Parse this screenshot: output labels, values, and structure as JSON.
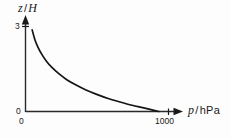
{
  "figure": {
    "background_color": "#fdfdfd",
    "ink_color": "#1a1a1a"
  },
  "axes": {
    "y": {
      "symbol": "z",
      "separator": "/",
      "unit": "H",
      "full_label": "z / H",
      "ticks": [
        "3",
        "0"
      ],
      "tick_values": [
        3,
        0
      ],
      "range": [
        0,
        3.4
      ]
    },
    "x": {
      "symbol": "p",
      "separator": "/",
      "unit": "hPa",
      "full_label": "p / hPa",
      "ticks": [
        "0",
        "1000"
      ],
      "tick_values": [
        0,
        1000
      ],
      "range": [
        0,
        1130
      ]
    }
  },
  "chart_data": {
    "type": "line",
    "title": "",
    "subtitle": "",
    "xlabel": "p / hPa",
    "ylabel": "z / H",
    "xlim": [
      0,
      1130
    ],
    "ylim": [
      0,
      3.4
    ],
    "grid": false,
    "legend": null,
    "legend_position": "none",
    "xticks": [
      0,
      1000
    ],
    "xticklabels": [
      "0",
      "1000"
    ],
    "yticks": [
      0,
      3
    ],
    "yticklabels": [
      "0",
      "3"
    ],
    "annotations": [],
    "series": [
      {
        "name": "barometric height vs pressure",
        "description": "exponential decay of normalized altitude with pressure",
        "x": [
          50,
          70,
          95,
          125,
          160,
          200,
          250,
          310,
          380,
          450,
          530,
          620,
          710,
          800,
          880,
          950,
          1000
        ],
        "y": [
          3.0,
          2.65,
          2.35,
          2.08,
          1.83,
          1.61,
          1.39,
          1.17,
          0.97,
          0.8,
          0.64,
          0.48,
          0.35,
          0.23,
          0.14,
          0.06,
          0.0
        ]
      }
    ]
  }
}
